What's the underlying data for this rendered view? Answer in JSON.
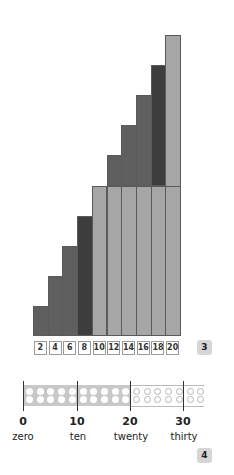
{
  "chart_data": {
    "type": "bar",
    "title": "",
    "categories": [
      "2",
      "4",
      "6",
      "8",
      "10",
      "12",
      "14",
      "16",
      "18",
      "20"
    ],
    "values": [
      2,
      4,
      6,
      8,
      10,
      12,
      14,
      16,
      18,
      20
    ],
    "xlabel": "",
    "ylabel": "",
    "ylim": [
      0,
      20
    ],
    "grid": false,
    "stacked_base_of_ten": true,
    "colors": {
      "dark_bars": "#5f5f5f",
      "darkest_bar": "#3d3d3d",
      "ten_block": "#a6a6a6",
      "twenty_top": "#a6a6a6"
    }
  },
  "panel3": {
    "labels": [
      "2",
      "4",
      "6",
      "8",
      "10",
      "12",
      "14",
      "16",
      "18",
      "20"
    ],
    "badge": "3"
  },
  "panel4": {
    "badge": "4",
    "number_line": {
      "ticks": [
        {
          "value": "0",
          "word": "zero"
        },
        {
          "value": "10",
          "word": "ten"
        },
        {
          "value": "20",
          "word": "twenty"
        },
        {
          "value": "30",
          "word": "thirty"
        }
      ],
      "filled_count": 20,
      "total_columns": 17
    }
  }
}
